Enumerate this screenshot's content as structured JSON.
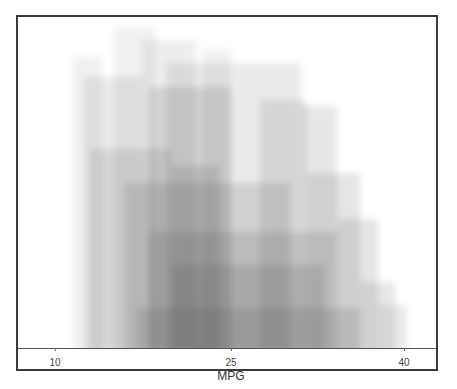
{
  "chart_data": {
    "type": "area",
    "title": "",
    "xlabel": "MPG",
    "ylabel": "",
    "xlim": [
      8.5,
      43.5
    ],
    "x_ticks": [
      10,
      25,
      40
    ],
    "grid": false,
    "legend": null,
    "bands": [
      {
        "x0": 11.5,
        "x1": 14.0,
        "top": 0.88,
        "alpha": 0.05
      },
      {
        "x0": 12.5,
        "x1": 17.5,
        "top": 0.82,
        "alpha": 0.07
      },
      {
        "x0": 15.0,
        "x1": 18.5,
        "top": 0.97,
        "alpha": 0.05
      },
      {
        "x0": 17.5,
        "x1": 22.0,
        "top": 0.93,
        "alpha": 0.06
      },
      {
        "x0": 18.0,
        "x1": 25.0,
        "top": 0.79,
        "alpha": 0.1
      },
      {
        "x0": 19.5,
        "x1": 25.0,
        "top": 0.86,
        "alpha": 0.07
      },
      {
        "x0": 20.0,
        "x1": 24.0,
        "top": 0.55,
        "alpha": 0.1
      },
      {
        "x0": 22.5,
        "x1": 25.0,
        "top": 0.9,
        "alpha": 0.05
      },
      {
        "x0": 25.0,
        "x1": 31.0,
        "top": 0.86,
        "alpha": 0.07
      },
      {
        "x0": 27.5,
        "x1": 31.5,
        "top": 0.75,
        "alpha": 0.08
      },
      {
        "x0": 31.0,
        "x1": 34.0,
        "top": 0.73,
        "alpha": 0.08
      },
      {
        "x0": 31.5,
        "x1": 36.0,
        "top": 0.53,
        "alpha": 0.09
      },
      {
        "x0": 34.0,
        "x1": 37.5,
        "top": 0.39,
        "alpha": 0.09
      },
      {
        "x0": 36.0,
        "x1": 39.0,
        "top": 0.2,
        "alpha": 0.08
      },
      {
        "x0": 37.5,
        "x1": 40.0,
        "top": 0.13,
        "alpha": 0.07
      },
      {
        "x0": 13.0,
        "x1": 20.0,
        "top": 0.6,
        "alpha": 0.08
      },
      {
        "x0": 16.0,
        "x1": 30.0,
        "top": 0.5,
        "alpha": 0.1
      },
      {
        "x0": 18.0,
        "x1": 34.0,
        "top": 0.35,
        "alpha": 0.1
      },
      {
        "x0": 20.0,
        "x1": 33.0,
        "top": 0.25,
        "alpha": 0.1
      },
      {
        "x0": 17.0,
        "x1": 36.0,
        "top": 0.12,
        "alpha": 0.1
      }
    ]
  },
  "axis": {
    "tick_labels": [
      "10",
      "25",
      "40"
    ],
    "xlabel": "MPG"
  },
  "colors": {
    "band": "#505050",
    "frame": "#3a3a3a",
    "background": "#ffffff"
  }
}
